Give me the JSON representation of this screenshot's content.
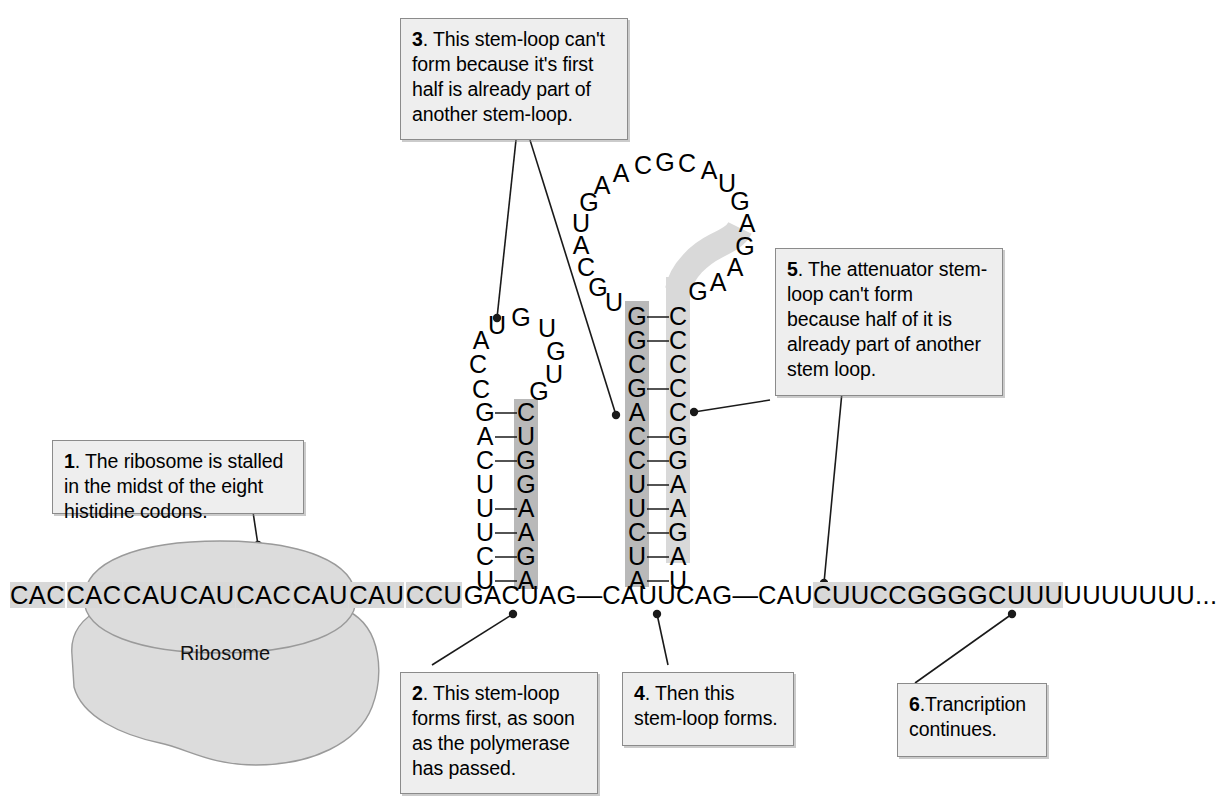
{
  "figure": {
    "ribosome_label": "Ribosome"
  },
  "callouts": [
    {
      "id": 1,
      "number": "1",
      "text": ". The ribosome is stalled in the midst of the eight histidine codons."
    },
    {
      "id": 2,
      "number": "2",
      "text": ". This stem-loop forms first, as soon as the polymerase has passed."
    },
    {
      "id": 3,
      "number": "3",
      "text": ". This stem-loop can't form because it's first half is already part of another stem-loop."
    },
    {
      "id": 4,
      "number": "4",
      "text": ". Then this stem-loop forms."
    },
    {
      "id": 5,
      "number": "5",
      "text": ". The attenuator stem-loop can't form because half of it is already part of another stem loop."
    },
    {
      "id": 6,
      "number": "6",
      "text": ".Trancription continues."
    }
  ],
  "mrna": {
    "codons": [
      "CAC",
      "CAC",
      "CAU",
      "CAU",
      "CAC",
      "CAU",
      "CAU",
      "CCU"
    ],
    "after_codons": "GACUAG",
    "dash1": "—",
    "segment2": "CAUUCAG",
    "dash2": "—",
    "segment3": "CAU",
    "attenuator": "CUUCCGGGGCUUU",
    "poly_u": "UUUUUUU",
    "ellipsis": "..."
  },
  "stem_loop_left": {
    "name": "stem-loop-2",
    "left_strand_bottom_up": [
      "U",
      "C",
      "U",
      "U",
      "U",
      "C",
      "A",
      "G"
    ],
    "left_loop_up": [
      "C",
      "C",
      "A",
      "U"
    ],
    "loop_top": [
      "G"
    ],
    "right_loop_down": [
      "U",
      "G",
      "U",
      "G"
    ],
    "right_strand_top_down": [
      "C",
      "U",
      "G",
      "G",
      "A",
      "A",
      "G",
      "A"
    ],
    "right_highlight": "dark"
  },
  "stem_loop_middle": {
    "name": "stem-loop-4",
    "left_strand_top_down": [
      "G",
      "G",
      "C",
      "G",
      "A",
      "C",
      "C",
      "U",
      "U",
      "C",
      "U",
      "A"
    ],
    "right_strand_top_down": [
      "C",
      "C",
      "C",
      "C",
      "C",
      "G",
      "G",
      "A",
      "A",
      "G",
      "A",
      "U"
    ],
    "left_highlight": "dark",
    "right_highlight": "light",
    "big_loop_ccw": [
      "U",
      "G",
      "C",
      "A",
      "U",
      "G",
      "A",
      "A",
      "C",
      "G",
      "C",
      "A",
      "U",
      "G",
      "A",
      "G",
      "A",
      "A",
      "G"
    ],
    "big_loop_highlight_tail": [
      "A",
      "A",
      "G"
    ]
  },
  "colors": {
    "callout_bg": "#eeeeee",
    "callout_border": "#8b8b8b",
    "highlight_dark": "#b9b9b9",
    "highlight_light": "#d9d9d9",
    "sequence_highlight": "#d8d8d8",
    "ribosome_fill": "#dcdcdc",
    "ribosome_stroke": "#9a9a9a",
    "line": "#1a1a1a"
  }
}
